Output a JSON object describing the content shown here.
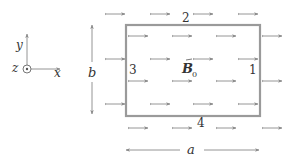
{
  "figure": {
    "field_label": "B",
    "field_subscript": "0",
    "side_labels": {
      "right": "1",
      "top": "2",
      "left": "3",
      "bottom": "4"
    },
    "dimension_labels": {
      "width": "a",
      "height": "b"
    },
    "axes": {
      "x": "x",
      "y": "y",
      "z": "z"
    },
    "colors": {
      "loop": "#9a9a9a",
      "field_arrow": "#8a8a8a",
      "dimension": "#888888",
      "text": "#333333"
    }
  },
  "field_arrows": [
    {
      "x": 105,
      "y": 14
    },
    {
      "x": 150,
      "y": 14
    },
    {
      "x": 193,
      "y": 14
    },
    {
      "x": 238,
      "y": 14
    },
    {
      "x": 128,
      "y": 36
    },
    {
      "x": 172,
      "y": 36
    },
    {
      "x": 216,
      "y": 36
    },
    {
      "x": 262,
      "y": 36
    },
    {
      "x": 105,
      "y": 59
    },
    {
      "x": 150,
      "y": 59
    },
    {
      "x": 193,
      "y": 59
    },
    {
      "x": 238,
      "y": 59
    },
    {
      "x": 128,
      "y": 81
    },
    {
      "x": 172,
      "y": 81
    },
    {
      "x": 216,
      "y": 81
    },
    {
      "x": 262,
      "y": 81
    },
    {
      "x": 105,
      "y": 104
    },
    {
      "x": 150,
      "y": 104
    },
    {
      "x": 193,
      "y": 104
    },
    {
      "x": 238,
      "y": 104
    },
    {
      "x": 128,
      "y": 128
    },
    {
      "x": 172,
      "y": 128
    },
    {
      "x": 216,
      "y": 128
    },
    {
      "x": 262,
      "y": 128
    }
  ],
  "loop": {
    "x": 126,
    "y": 25,
    "width": 134,
    "height": 91
  }
}
